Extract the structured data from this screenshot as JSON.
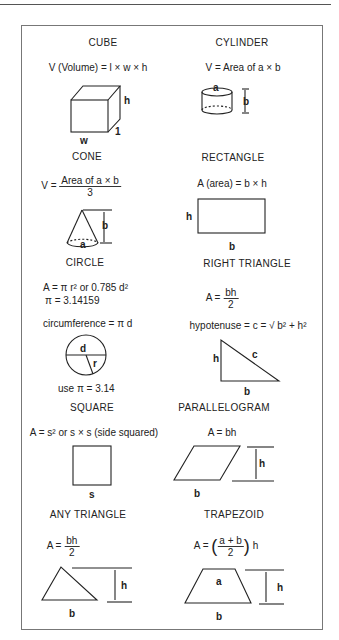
{
  "sections": [
    {
      "title": "CUBE",
      "formula": "V (Volume) = l × w × h",
      "labels": [
        "h",
        "w",
        "l"
      ]
    },
    {
      "title": "CYLINDER",
      "formula": "V = Area of a × b",
      "labels": [
        "a",
        "b"
      ]
    },
    {
      "title": "CONE",
      "formula_lhs": "V =",
      "formula_num": "Area of a × b",
      "formula_den": "3",
      "labels": [
        "b",
        "a"
      ]
    },
    {
      "title": "RECTANGLE",
      "formula": "A (area) = b × h",
      "labels": [
        "h",
        "b"
      ]
    },
    {
      "title": "CIRCLE",
      "formula": "A = π r² or 0.785 d²",
      "formula2": "π = 3.14159",
      "formula3": "circumference = π d",
      "note": "use π = 3.14",
      "labels": [
        "d",
        "r"
      ]
    },
    {
      "title": "RIGHT TRIANGLE",
      "formula_lhs": "A =",
      "formula_num": "bh",
      "formula_den": "2",
      "formula2": "hypotenuse = c = √ b² + h²",
      "labels": [
        "h",
        "c",
        "b"
      ]
    },
    {
      "title": "SQUARE",
      "formula": "A = s² or s × s (side squared)",
      "labels": [
        "s"
      ]
    },
    {
      "title": "PARALLELOGRAM",
      "formula": "A = bh",
      "labels": [
        "h",
        "b"
      ]
    },
    {
      "title": "ANY TRIANGLE",
      "formula_lhs": "A =",
      "formula_num": "bh",
      "formula_den": "2",
      "labels": [
        "h",
        "b"
      ]
    },
    {
      "title": "TRAPEZOID",
      "formula_lhs": "A =",
      "formula_num": "a + b",
      "formula_den": "2",
      "formula_rhs": "h",
      "labels": [
        "a",
        "h",
        "b"
      ]
    }
  ]
}
